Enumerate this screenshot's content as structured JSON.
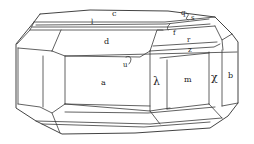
{
  "figure": {
    "type": "crystal-drawing",
    "colors": {
      "line": "#3a3a3a",
      "background": "#ffffff",
      "text": "#222222"
    }
  },
  "faces": {
    "c": "c",
    "l": "l",
    "d": "d",
    "q": "q",
    "s": "s",
    "f": "f",
    "r": "r",
    "z": "z",
    "u": "u",
    "a": "a",
    "lambda": "λ",
    "m": "m",
    "chi": "χ",
    "b": "b"
  }
}
